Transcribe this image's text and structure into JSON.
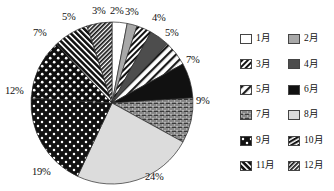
{
  "chart_data": {
    "type": "pie",
    "title": "",
    "categories": [
      "1月",
      "2月",
      "3月",
      "4月",
      "5月",
      "6月",
      "7月",
      "8月",
      "9月",
      "10月",
      "11月",
      "12月"
    ],
    "values": [
      3,
      2,
      3,
      4,
      5,
      7,
      9,
      24,
      19,
      12,
      7,
      5
    ],
    "value_labels": [
      "3%",
      "2%",
      "3%",
      "4%",
      "5%",
      "7%",
      "9%",
      "24%",
      "19%",
      "12%",
      "7%",
      "5%"
    ],
    "unit": "%",
    "start_angle_deg": 0,
    "direction": "clockwise",
    "labels_outside": true,
    "grid": false,
    "legend_position": "right",
    "legend_columns": 2,
    "xlabel": "",
    "ylabel": ""
  },
  "pie": {
    "cx": 112,
    "cy": 103,
    "r": 81,
    "slices": [
      {
        "label": "1月",
        "value": 3,
        "pct_text": "3%",
        "fill": "#ffffff",
        "pattern": "solid",
        "label_x": 92,
        "label_y": 6
      },
      {
        "label": "2月",
        "value": 2,
        "pct_text": "2%",
        "fill": "#a8a8a8",
        "pattern": "solid",
        "label_x": 110,
        "label_y": 6
      },
      {
        "label": "3月",
        "value": 3,
        "pct_text": "3%",
        "fill": "#d9d9d9",
        "pattern": "hatch-dense",
        "label_x": 125,
        "label_y": 7
      },
      {
        "label": "4月",
        "value": 4,
        "pct_text": "4%",
        "fill": "#4d4d4d",
        "pattern": "solid",
        "label_x": 152,
        "label_y": 13
      },
      {
        "label": "5月",
        "value": 5,
        "pct_text": "5%",
        "fill": "#e0e0e0",
        "pattern": "stripe-wide",
        "label_x": 165,
        "label_y": 28
      },
      {
        "label": "6月",
        "value": 7,
        "pct_text": "7%",
        "fill": "#111111",
        "pattern": "solid",
        "label_x": 186,
        "label_y": 55
      },
      {
        "label": "7月",
        "value": 9,
        "pct_text": "9%",
        "fill": "#2b2b2b",
        "pattern": "brick",
        "label_x": 196,
        "label_y": 96
      },
      {
        "label": "8月",
        "value": 24,
        "pct_text": "24%",
        "fill": "#dcdcdc",
        "pattern": "solid",
        "label_x": 145,
        "label_y": 172
      },
      {
        "label": "9月",
        "value": 19,
        "pct_text": "19%",
        "fill": "#1c1c1c",
        "pattern": "confetti",
        "label_x": 32,
        "label_y": 167
      },
      {
        "label": "10月",
        "value": 12,
        "pct_text": "12%",
        "fill": "#141414",
        "pattern": "dots-white",
        "label_x": 5,
        "label_y": 86
      },
      {
        "label": "11月",
        "value": 7,
        "pct_text": "7%",
        "fill": "#1f1f1f",
        "pattern": "hatch-left",
        "label_x": 33,
        "label_y": 28
      },
      {
        "label": "12月",
        "value": 5,
        "pct_text": "5%",
        "fill": "#222222",
        "pattern": "hatch-tight",
        "label_x": 62,
        "label_y": 12
      }
    ]
  },
  "legend": {
    "columns": [
      {
        "items": [
          {
            "label": "1月",
            "swatch": "swatch-white"
          },
          {
            "label": "3月",
            "swatch": "swatch-hatch-dense"
          },
          {
            "label": "5月",
            "swatch": "swatch-stripe-wide"
          },
          {
            "label": "7月",
            "swatch": "swatch-brick"
          },
          {
            "label": "9月",
            "swatch": "swatch-confetti"
          },
          {
            "label": "11月",
            "swatch": "swatch-hatch-left"
          }
        ]
      },
      {
        "items": [
          {
            "label": "2月",
            "swatch": "swatch-gray"
          },
          {
            "label": "4月",
            "swatch": "swatch-darkgray"
          },
          {
            "label": "6月",
            "swatch": "swatch-black"
          },
          {
            "label": "8月",
            "swatch": "swatch-lightgray"
          },
          {
            "label": "10月",
            "swatch": "swatch-hatch-dense2"
          },
          {
            "label": "12月",
            "swatch": "swatch-hatch-tight"
          }
        ]
      }
    ]
  }
}
